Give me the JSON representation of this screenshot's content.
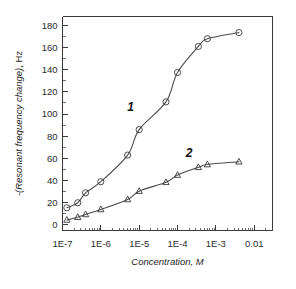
{
  "chart_data": {
    "type": "scatter",
    "title": "",
    "xlabel": "Concentration, M",
    "ylabel": "-(Resonant frequency change), Hz",
    "xscale": "log",
    "xlim": [
      1e-07,
      0.03
    ],
    "ylim": [
      -5,
      188
    ],
    "grid": false,
    "legend_position": "inline-curve-labels",
    "xticks": [
      {
        "value": 1e-07,
        "label": "1E-7"
      },
      {
        "value": 1e-06,
        "label": "1E-6"
      },
      {
        "value": 1e-05,
        "label": "1E-5"
      },
      {
        "value": 0.0001,
        "label": "1E-4"
      },
      {
        "value": 0.001,
        "label": "1E-3"
      },
      {
        "value": 0.01,
        "label": "0.01"
      }
    ],
    "yticks": [
      {
        "value": 0,
        "label": "0"
      },
      {
        "value": 20,
        "label": "20"
      },
      {
        "value": 40,
        "label": "40"
      },
      {
        "value": 60,
        "label": "60"
      },
      {
        "value": 80,
        "label": "80"
      },
      {
        "value": 100,
        "label": "100"
      },
      {
        "value": 120,
        "label": "120"
      },
      {
        "value": 140,
        "label": "140"
      },
      {
        "value": 160,
        "label": "160"
      },
      {
        "value": 180,
        "label": "180"
      }
    ],
    "series": [
      {
        "name": "1",
        "annotation_label": "1",
        "marker": "open-circle",
        "color": "#3a3a3a",
        "points": [
          {
            "x": 1.3e-07,
            "y": 15.5
          },
          {
            "x": 2.5e-07,
            "y": 20.0
          },
          {
            "x": 4e-07,
            "y": 29.0
          },
          {
            "x": 1e-06,
            "y": 39.0
          },
          {
            "x": 5e-06,
            "y": 63.0
          },
          {
            "x": 1e-05,
            "y": 86.0
          },
          {
            "x": 5e-05,
            "y": 111.0
          },
          {
            "x": 0.0001,
            "y": 137.5
          },
          {
            "x": 0.00035,
            "y": 161.0
          },
          {
            "x": 0.0006,
            "y": 168.0
          },
          {
            "x": 0.004,
            "y": 173.5
          }
        ]
      },
      {
        "name": "2",
        "annotation_label": "2",
        "marker": "open-triangle",
        "color": "#3a3a3a",
        "points": [
          {
            "x": 1.3e-07,
            "y": 4.5
          },
          {
            "x": 2.5e-07,
            "y": 7.0
          },
          {
            "x": 4e-07,
            "y": 9.5
          },
          {
            "x": 1e-06,
            "y": 14.0
          },
          {
            "x": 5e-06,
            "y": 23.0
          },
          {
            "x": 1e-05,
            "y": 30.5
          },
          {
            "x": 5e-05,
            "y": 38.5
          },
          {
            "x": 0.0001,
            "y": 45.0
          },
          {
            "x": 0.00035,
            "y": 52.0
          },
          {
            "x": 0.0006,
            "y": 54.5
          },
          {
            "x": 0.004,
            "y": 57.0
          }
        ]
      }
    ],
    "annotations": [
      {
        "text": "1",
        "x": 6e-06,
        "y": 103
      },
      {
        "text": "2",
        "x": 0.0002,
        "y": 61
      }
    ]
  },
  "axis_titles": {
    "y_main": "-(Resonant frequency change)",
    "y_unit": ", Hz",
    "x_main": "Concentration, M"
  }
}
